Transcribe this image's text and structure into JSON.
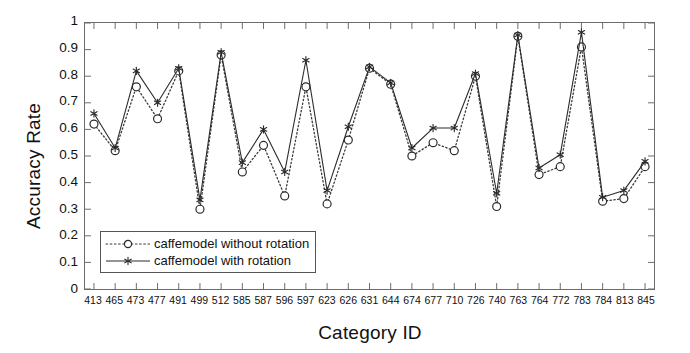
{
  "chart_data": {
    "type": "line",
    "title": "",
    "xlabel": "Category ID",
    "ylabel": "Accuracy Rate",
    "ylim": [
      0,
      1
    ],
    "ytick_labels": [
      "0",
      "0.1",
      "0.2",
      "0.3",
      "0.4",
      "0.5",
      "0.6",
      "0.7",
      "0.8",
      "0.9",
      "1"
    ],
    "ytick_values": [
      0,
      0.1,
      0.2,
      0.3,
      0.4,
      0.5,
      0.6,
      0.7,
      0.8,
      0.9,
      1
    ],
    "grid": false,
    "legend_position": "lower-left-inside",
    "categories": [
      "413",
      "465",
      "473",
      "477",
      "491",
      "499",
      "512",
      "585",
      "587",
      "596",
      "597",
      "623",
      "626",
      "631",
      "644",
      "674",
      "677",
      "710",
      "726",
      "740",
      "763",
      "764",
      "772",
      "783",
      "784",
      "813",
      "845"
    ],
    "series": [
      {
        "name": "caffemodel without rotation",
        "marker": "circle",
        "linestyle": "dotted",
        "color": "#3a3a3a",
        "values": [
          0.62,
          0.52,
          0.76,
          0.64,
          0.82,
          0.3,
          0.88,
          0.44,
          0.54,
          0.35,
          0.76,
          0.32,
          0.56,
          0.83,
          0.77,
          0.5,
          0.55,
          0.52,
          0.8,
          0.31,
          0.95,
          0.43,
          0.46,
          0.91,
          0.33,
          0.34,
          0.46
        ]
      },
      {
        "name": "caffemodel with rotation",
        "marker": "asterisk",
        "linestyle": "solid",
        "color": "#2b2b2b",
        "values": [
          0.66,
          0.53,
          0.82,
          0.7,
          0.83,
          0.335,
          0.89,
          0.475,
          0.6,
          0.44,
          0.86,
          0.37,
          0.61,
          0.835,
          0.775,
          0.53,
          0.605,
          0.605,
          0.81,
          0.36,
          0.955,
          0.455,
          0.505,
          0.965,
          0.345,
          0.37,
          0.48
        ]
      }
    ]
  },
  "legend": {
    "items": [
      {
        "label": "caffemodel without rotation"
      },
      {
        "label": "caffemodel with rotation"
      }
    ]
  },
  "axes": {
    "y_axis_label": "Accuracy Rate",
    "x_axis_label": "Category ID"
  }
}
